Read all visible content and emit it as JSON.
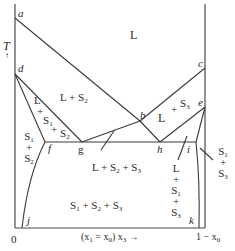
{
  "figure": {
    "type": "ternary-section phase diagram",
    "axis": {
      "y_label": "T",
      "y_arrow": "↑",
      "x_origin": "0",
      "x_label_prefix": "(x",
      "x_label_sub1": "1",
      "x_label_eq": " = x",
      "x_label_sub0": "0",
      "x_label_mid": ") x",
      "x_label_sub3": "3",
      "x_label_arrow": " →",
      "x_end_prefix": "1 − x",
      "x_end_sub": "0"
    },
    "points": {
      "a": "a",
      "b": "b",
      "c": "c",
      "d": "d",
      "e": "e",
      "f": "f",
      "g": "g",
      "h": "h",
      "i": "i",
      "j": "j",
      "k": "k"
    },
    "regions": {
      "liquid": "L",
      "l_s2": {
        "a": "L + S",
        "sub": "2"
      },
      "l_s1_s2": [
        "L",
        "+",
        "S1",
        "+",
        "S2"
      ],
      "s1_s2": [
        "S1",
        "+",
        "S2"
      ],
      "l_s3": [
        "L",
        "+",
        "S3"
      ],
      "l_s2_s3": {
        "a": "L + S",
        "s2": "2",
        "b": " + S",
        "s3": "3"
      },
      "s1_s2_s3": {
        "a": "S",
        "s1": "1",
        "b": " + S",
        "s2": "2",
        "c": " + S",
        "s3": "3"
      },
      "l_s1_s3": [
        "L",
        "+",
        "S1",
        "+",
        "S3"
      ],
      "s1_s3": [
        "S1",
        "+",
        "S3"
      ]
    },
    "colors": {
      "line": "#3a3a3a",
      "text": "#2a2a2a",
      "background": "#ffffff"
    }
  }
}
